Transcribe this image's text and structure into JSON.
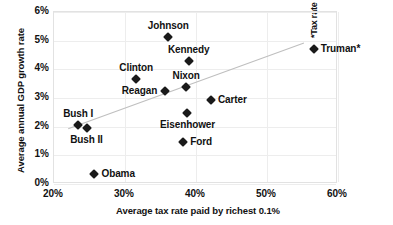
{
  "chart_data": {
    "type": "scatter",
    "title": "",
    "xlabel": "Average tax rate paid by richest 0.1%",
    "ylabel": "Average annual GDP growth rate",
    "footnote": "*Tax rate for post-war period only.",
    "xlim": [
      20,
      60
    ],
    "ylim": [
      0,
      6
    ],
    "xticks": [
      "20%",
      "30%",
      "40%",
      "50%",
      "60%"
    ],
    "xtick_values": [
      20,
      30,
      40,
      50,
      60
    ],
    "yticks": [
      "0%",
      "1%",
      "2%",
      "3%",
      "4%",
      "5%",
      "6%"
    ],
    "ytick_values": [
      0,
      1,
      2,
      3,
      4,
      5,
      6
    ],
    "grid": true,
    "legend": "none",
    "marker_color": "#1a1a1a",
    "trendline_color": "#bfbfbf",
    "trendline": {
      "x_start": 22.0,
      "y_start": 1.93,
      "x_end": 55.2,
      "y_end": 4.92
    },
    "points": [
      {
        "name": "Johnson",
        "x": 36.1,
        "y": 5.14,
        "label": "Johnson",
        "label_pos": "top"
      },
      {
        "name": "Kennedy",
        "x": 39.0,
        "y": 4.3,
        "label": "Kennedy",
        "label_pos": "top"
      },
      {
        "name": "Clinton",
        "x": 31.6,
        "y": 3.65,
        "label": "Clinton",
        "label_pos": "top"
      },
      {
        "name": "Nixon",
        "x": 38.6,
        "y": 3.37,
        "label": "Nixon",
        "label_pos": "top"
      },
      {
        "name": "Reagan",
        "x": 35.6,
        "y": 3.23,
        "label": "Reagan",
        "label_pos": "left"
      },
      {
        "name": "Carter",
        "x": 42.1,
        "y": 2.94,
        "label": "Carter",
        "label_pos": "right"
      },
      {
        "name": "Eisenhower",
        "x": 38.8,
        "y": 2.48,
        "label": "Eisenhower",
        "label_pos": "bottom"
      },
      {
        "name": "Bush I",
        "x": 23.4,
        "y": 2.05,
        "label": "Bush I",
        "label_pos": "top"
      },
      {
        "name": "Bush II",
        "x": 24.6,
        "y": 1.95,
        "label": "Bush II",
        "label_pos": "bottom"
      },
      {
        "name": "Ford",
        "x": 38.2,
        "y": 1.45,
        "label": "Ford",
        "label_pos": "right"
      },
      {
        "name": "Obama",
        "x": 25.7,
        "y": 0.35,
        "label": "Obama",
        "label_pos": "right"
      },
      {
        "name": "Truman",
        "x": 56.6,
        "y": 4.72,
        "label": "Truman*",
        "label_pos": "right"
      }
    ]
  }
}
